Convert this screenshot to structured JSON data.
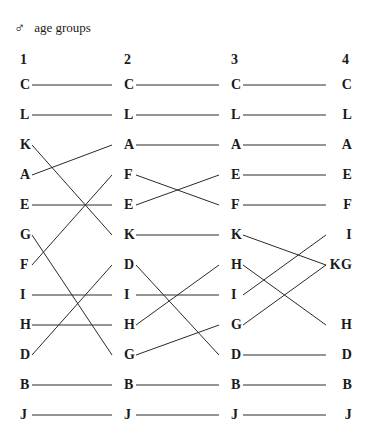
{
  "header": {
    "sex_symbol": "♂",
    "sex_symbol_name": "male-symbol-icon",
    "title": "age groups"
  },
  "columns": [
    {
      "label": "1",
      "x": 20,
      "align": "left"
    },
    {
      "label": "2",
      "x": 124,
      "align": "left"
    },
    {
      "label": "3",
      "x": 231,
      "align": "left"
    },
    {
      "label": "4",
      "x": 352,
      "align": "right"
    }
  ],
  "geometry": {
    "row_top": 85,
    "row_step": 30,
    "rows": 12,
    "line_color": "#2a2a2a",
    "text_color": "#1a1a1a",
    "background": "#ffffff"
  },
  "chart_data": {
    "type": "bump",
    "title": "age groups",
    "categories": [
      "1",
      "2",
      "3",
      "4"
    ],
    "ranks": [
      1,
      2,
      3,
      4,
      5,
      6,
      7,
      8,
      9,
      10,
      11,
      12
    ],
    "columns_items": [
      [
        "C",
        "L",
        "K",
        "A",
        "E",
        "G",
        "F",
        "I",
        "H",
        "D",
        "B",
        "J"
      ],
      [
        "C",
        "L",
        "A",
        "F",
        "E",
        "K",
        "D",
        "I",
        "H",
        "G",
        "B",
        "J"
      ],
      [
        "C",
        "L",
        "A",
        "E",
        "F",
        "K",
        "H",
        "I",
        "G",
        "D",
        "B",
        "J"
      ],
      [
        "C",
        "L",
        "A",
        "E",
        "F",
        "I",
        "KG",
        "",
        "H",
        "D",
        "B",
        "J"
      ]
    ],
    "series": [
      {
        "name": "C",
        "ranks": [
          1,
          1,
          1,
          1
        ]
      },
      {
        "name": "L",
        "ranks": [
          2,
          2,
          2,
          2
        ]
      },
      {
        "name": "A",
        "ranks": [
          4,
          3,
          3,
          3
        ]
      },
      {
        "name": "E",
        "ranks": [
          5,
          5,
          4,
          4
        ]
      },
      {
        "name": "F",
        "ranks": [
          7,
          4,
          5,
          5
        ]
      },
      {
        "name": "I",
        "ranks": [
          8,
          8,
          8,
          6
        ]
      },
      {
        "name": "K",
        "ranks": [
          3,
          6,
          6,
          7
        ]
      },
      {
        "name": "G",
        "ranks": [
          6,
          10,
          9,
          7
        ]
      },
      {
        "name": "H",
        "ranks": [
          9,
          9,
          7,
          9
        ]
      },
      {
        "name": "D",
        "ranks": [
          10,
          7,
          10,
          10
        ]
      },
      {
        "name": "B",
        "ranks": [
          11,
          11,
          11,
          11
        ]
      },
      {
        "name": "J",
        "ranks": [
          12,
          12,
          12,
          12
        ]
      }
    ]
  },
  "nodes": [
    {
      "label": "C",
      "col": 0,
      "row": 1
    },
    {
      "label": "L",
      "col": 0,
      "row": 2
    },
    {
      "label": "K",
      "col": 0,
      "row": 3
    },
    {
      "label": "A",
      "col": 0,
      "row": 4
    },
    {
      "label": "E",
      "col": 0,
      "row": 5
    },
    {
      "label": "G",
      "col": 0,
      "row": 6
    },
    {
      "label": "F",
      "col": 0,
      "row": 7
    },
    {
      "label": "I",
      "col": 0,
      "row": 8
    },
    {
      "label": "H",
      "col": 0,
      "row": 9
    },
    {
      "label": "D",
      "col": 0,
      "row": 10
    },
    {
      "label": "B",
      "col": 0,
      "row": 11
    },
    {
      "label": "J",
      "col": 0,
      "row": 12
    },
    {
      "label": "C",
      "col": 1,
      "row": 1
    },
    {
      "label": "L",
      "col": 1,
      "row": 2
    },
    {
      "label": "A",
      "col": 1,
      "row": 3
    },
    {
      "label": "F",
      "col": 1,
      "row": 4
    },
    {
      "label": "E",
      "col": 1,
      "row": 5
    },
    {
      "label": "K",
      "col": 1,
      "row": 6
    },
    {
      "label": "D",
      "col": 1,
      "row": 7
    },
    {
      "label": "I",
      "col": 1,
      "row": 8
    },
    {
      "label": "H",
      "col": 1,
      "row": 9
    },
    {
      "label": "G",
      "col": 1,
      "row": 10
    },
    {
      "label": "B",
      "col": 1,
      "row": 11
    },
    {
      "label": "J",
      "col": 1,
      "row": 12
    },
    {
      "label": "C",
      "col": 2,
      "row": 1
    },
    {
      "label": "L",
      "col": 2,
      "row": 2
    },
    {
      "label": "A",
      "col": 2,
      "row": 3
    },
    {
      "label": "E",
      "col": 2,
      "row": 4
    },
    {
      "label": "F",
      "col": 2,
      "row": 5
    },
    {
      "label": "K",
      "col": 2,
      "row": 6
    },
    {
      "label": "H",
      "col": 2,
      "row": 7
    },
    {
      "label": "I",
      "col": 2,
      "row": 8
    },
    {
      "label": "G",
      "col": 2,
      "row": 9
    },
    {
      "label": "D",
      "col": 2,
      "row": 10
    },
    {
      "label": "B",
      "col": 2,
      "row": 11
    },
    {
      "label": "J",
      "col": 2,
      "row": 12
    },
    {
      "label": "C",
      "col": 3,
      "row": 1
    },
    {
      "label": "L",
      "col": 3,
      "row": 2
    },
    {
      "label": "A",
      "col": 3,
      "row": 3
    },
    {
      "label": "E",
      "col": 3,
      "row": 4
    },
    {
      "label": "F",
      "col": 3,
      "row": 5
    },
    {
      "label": "I",
      "col": 3,
      "row": 6
    },
    {
      "label": "KG",
      "col": 3,
      "row": 7
    },
    {
      "label": "H",
      "col": 3,
      "row": 9
    },
    {
      "label": "D",
      "col": 3,
      "row": 10
    },
    {
      "label": "B",
      "col": 3,
      "row": 11
    },
    {
      "label": "J",
      "col": 3,
      "row": 12
    }
  ],
  "links": [
    {
      "label": "C",
      "seg": 0,
      "from_row": 1,
      "to_row": 1
    },
    {
      "label": "L",
      "seg": 0,
      "from_row": 2,
      "to_row": 2
    },
    {
      "label": "K",
      "seg": 0,
      "from_row": 3,
      "to_row": 6
    },
    {
      "label": "A",
      "seg": 0,
      "from_row": 4,
      "to_row": 3
    },
    {
      "label": "E",
      "seg": 0,
      "from_row": 5,
      "to_row": 5
    },
    {
      "label": "G",
      "seg": 0,
      "from_row": 6,
      "to_row": 10
    },
    {
      "label": "F",
      "seg": 0,
      "from_row": 7,
      "to_row": 4
    },
    {
      "label": "I",
      "seg": 0,
      "from_row": 8,
      "to_row": 8
    },
    {
      "label": "H",
      "seg": 0,
      "from_row": 9,
      "to_row": 9
    },
    {
      "label": "D",
      "seg": 0,
      "from_row": 10,
      "to_row": 7
    },
    {
      "label": "B",
      "seg": 0,
      "from_row": 11,
      "to_row": 11
    },
    {
      "label": "J",
      "seg": 0,
      "from_row": 12,
      "to_row": 12
    },
    {
      "label": "C",
      "seg": 1,
      "from_row": 1,
      "to_row": 1
    },
    {
      "label": "L",
      "seg": 1,
      "from_row": 2,
      "to_row": 2
    },
    {
      "label": "A",
      "seg": 1,
      "from_row": 3,
      "to_row": 3
    },
    {
      "label": "F",
      "seg": 1,
      "from_row": 4,
      "to_row": 5
    },
    {
      "label": "E",
      "seg": 1,
      "from_row": 5,
      "to_row": 4
    },
    {
      "label": "K",
      "seg": 1,
      "from_row": 6,
      "to_row": 6
    },
    {
      "label": "D",
      "seg": 1,
      "from_row": 7,
      "to_row": 10
    },
    {
      "label": "I",
      "seg": 1,
      "from_row": 8,
      "to_row": 8
    },
    {
      "label": "H",
      "seg": 1,
      "from_row": 9,
      "to_row": 7
    },
    {
      "label": "G",
      "seg": 1,
      "from_row": 10,
      "to_row": 9
    },
    {
      "label": "B",
      "seg": 1,
      "from_row": 11,
      "to_row": 11
    },
    {
      "label": "J",
      "seg": 1,
      "from_row": 12,
      "to_row": 12
    },
    {
      "label": "C",
      "seg": 2,
      "from_row": 1,
      "to_row": 1
    },
    {
      "label": "L",
      "seg": 2,
      "from_row": 2,
      "to_row": 2
    },
    {
      "label": "A",
      "seg": 2,
      "from_row": 3,
      "to_row": 3
    },
    {
      "label": "E",
      "seg": 2,
      "from_row": 4,
      "to_row": 4
    },
    {
      "label": "F",
      "seg": 2,
      "from_row": 5,
      "to_row": 5
    },
    {
      "label": "K",
      "seg": 2,
      "from_row": 6,
      "to_row": 7
    },
    {
      "label": "H",
      "seg": 2,
      "from_row": 7,
      "to_row": 9
    },
    {
      "label": "I",
      "seg": 2,
      "from_row": 8,
      "to_row": 6
    },
    {
      "label": "G",
      "seg": 2,
      "from_row": 9,
      "to_row": 7
    },
    {
      "label": "D",
      "seg": 2,
      "from_row": 10,
      "to_row": 10
    },
    {
      "label": "B",
      "seg": 2,
      "from_row": 11,
      "to_row": 11
    },
    {
      "label": "J",
      "seg": 2,
      "from_row": 12,
      "to_row": 12
    }
  ]
}
